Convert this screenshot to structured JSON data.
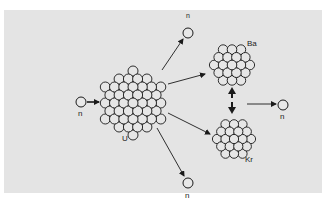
{
  "diagram": {
    "type": "nuclear-fission",
    "background_color": "#e4e4e4",
    "ink_color": "#1a1a1a",
    "nodes": {
      "incoming_neutron": {
        "label": "n",
        "x": 81,
        "y": 102
      },
      "uranium": {
        "label": "U",
        "x": 133,
        "y": 103
      },
      "barium": {
        "label": "Ba",
        "x": 232,
        "y": 65
      },
      "krypton": {
        "label": "Kr",
        "x": 234,
        "y": 139
      },
      "neutron_top": {
        "label": "n",
        "x": 188,
        "y": 33
      },
      "neutron_right": {
        "label": "n",
        "x": 283,
        "y": 106
      },
      "neutron_bottom": {
        "label": "n",
        "x": 188,
        "y": 183
      }
    },
    "edges": [
      {
        "from": "incoming_neutron",
        "to": "uranium"
      },
      {
        "from": "uranium",
        "to": "neutron_top"
      },
      {
        "from": "uranium",
        "to": "barium"
      },
      {
        "from": "uranium",
        "to": "krypton"
      },
      {
        "from": "uranium",
        "to": "neutron_bottom"
      },
      {
        "from": "barium",
        "to": "krypton",
        "style": "double-headed"
      },
      {
        "from": "double-arrow",
        "to": "neutron_right"
      }
    ]
  }
}
